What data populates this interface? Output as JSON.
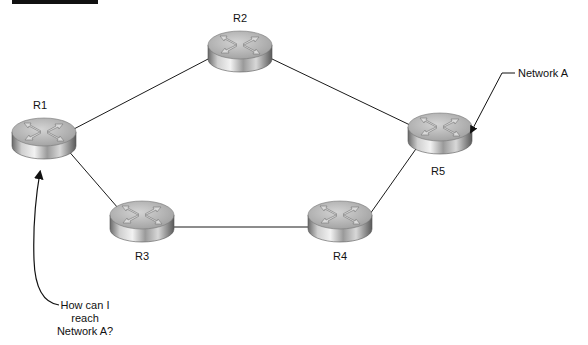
{
  "figure": {
    "caption_bar": true
  },
  "routers": [
    {
      "id": "R1",
      "label": "R1",
      "x": 44,
      "y": 138
    },
    {
      "id": "R2",
      "label": "R2",
      "x": 240,
      "y": 51
    },
    {
      "id": "R3",
      "label": "R3",
      "x": 142,
      "y": 221
    },
    {
      "id": "R4",
      "label": "R4",
      "x": 340,
      "y": 221
    },
    {
      "id": "R5",
      "label": "R5",
      "x": 440,
      "y": 133
    }
  ],
  "links": [
    {
      "from": "R1",
      "to": "R2"
    },
    {
      "from": "R2",
      "to": "R5"
    },
    {
      "from": "R1",
      "to": "R3"
    },
    {
      "from": "R3",
      "to": "R4"
    },
    {
      "from": "R4",
      "to": "R5"
    }
  ],
  "annotations": {
    "network_label": "Network A",
    "question_lines": [
      "How can I",
      "reach",
      "Network A?"
    ]
  },
  "colors": {
    "line": "#1a1a1a",
    "router_top": "#b8b8b8",
    "router_side_dark": "#5a5a5a",
    "router_side_light": "#e8e8e8"
  }
}
